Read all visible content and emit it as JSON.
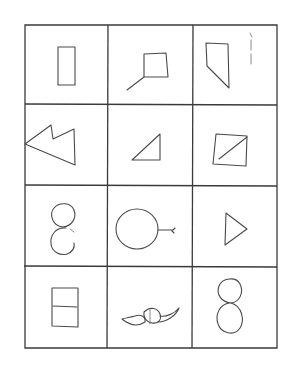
{
  "figure": {
    "rows": 4,
    "cols": 3,
    "line_color": "#3a3a3a",
    "stroke_color": "#4a4a4a",
    "background": "#ffffff",
    "cells": [
      {
        "row": 0,
        "col": 0,
        "shape": "tall-rectangle"
      },
      {
        "row": 0,
        "col": 1,
        "shape": "square-with-diagonal-tail"
      },
      {
        "row": 0,
        "col": 2,
        "shape": "trapezoid-with-small-mark"
      },
      {
        "row": 1,
        "col": 0,
        "shape": "double-arrow-polygon"
      },
      {
        "row": 1,
        "col": 1,
        "shape": "right-triangle"
      },
      {
        "row": 1,
        "col": 2,
        "shape": "square-with-diagonal"
      },
      {
        "row": 2,
        "col": 0,
        "shape": "open-figure-eight"
      },
      {
        "row": 2,
        "col": 1,
        "shape": "circle-with-tail"
      },
      {
        "row": 2,
        "col": 2,
        "shape": "right-pointing-triangle"
      },
      {
        "row": 3,
        "col": 0,
        "shape": "rectangle-with-horizontal-divider"
      },
      {
        "row": 3,
        "col": 1,
        "shape": "mustache-like-figure"
      },
      {
        "row": 3,
        "col": 2,
        "shape": "figure-eight"
      }
    ]
  }
}
